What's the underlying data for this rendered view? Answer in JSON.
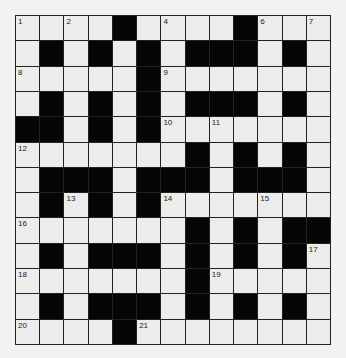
{
  "puzzle": {
    "rows": 13,
    "cols": 13,
    "colors": {
      "background": "#f2f2f0",
      "cell": "#ececea",
      "block": "#050505",
      "line": "#222222"
    },
    "layout": [
      "....#....#...",
      ".#.#.#.###.#.",
      ".....#.......",
      ".#.#.#.###.#.",
      "##.#.#.......",
      ".......#.#.#.",
      ".###.###.###.",
      ".#.#.#.......",
      ".......#.#.##",
      ".#.###.#.#.#.",
      ".......#.....",
      ".#.###.#.#.#.",
      "....#........"
    ],
    "numbers": [
      {
        "r": 0,
        "c": 0,
        "n": "1"
      },
      {
        "r": 0,
        "c": 2,
        "n": "2"
      },
      {
        "r": 0,
        "c": 4,
        "n": "3"
      },
      {
        "r": 0,
        "c": 6,
        "n": "4"
      },
      {
        "r": 0,
        "c": 9,
        "n": "5"
      },
      {
        "r": 0,
        "c": 10,
        "n": "6"
      },
      {
        "r": 0,
        "c": 12,
        "n": "7"
      },
      {
        "r": 2,
        "c": 0,
        "n": "8"
      },
      {
        "r": 2,
        "c": 6,
        "n": "9"
      },
      {
        "r": 4,
        "c": 6,
        "n": "10"
      },
      {
        "r": 4,
        "c": 8,
        "n": "11"
      },
      {
        "r": 5,
        "c": 0,
        "n": "12"
      },
      {
        "r": 7,
        "c": 2,
        "n": "13"
      },
      {
        "r": 7,
        "c": 6,
        "n": "14"
      },
      {
        "r": 7,
        "c": 10,
        "n": "15"
      },
      {
        "r": 8,
        "c": 0,
        "n": "16"
      },
      {
        "r": 9,
        "c": 12,
        "n": "17"
      },
      {
        "r": 10,
        "c": 0,
        "n": "18"
      },
      {
        "r": 10,
        "c": 8,
        "n": "19"
      },
      {
        "r": 12,
        "c": 0,
        "n": "20"
      },
      {
        "r": 12,
        "c": 5,
        "n": "21"
      }
    ]
  }
}
